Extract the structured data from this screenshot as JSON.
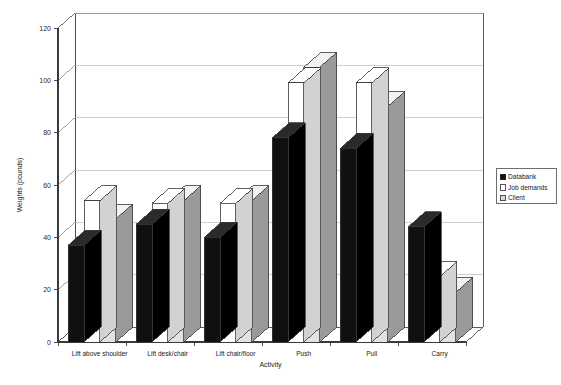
{
  "chart_data": {
    "type": "bar",
    "title": "",
    "subtitle": "",
    "xlabel": "Activity",
    "ylabel": "Weights (pounds)",
    "ylim": [
      0,
      120
    ],
    "yticks": [
      0,
      20,
      40,
      60,
      80,
      100,
      120
    ],
    "ytick_labels": [
      "0",
      "20",
      "40",
      "60",
      "80",
      "100",
      "120"
    ],
    "grid": "horizontal",
    "legend_position": "right",
    "style": "3d-grouped-columns",
    "categories": [
      "Lift above shoulder",
      "Lift desk/chair",
      "Lift chair/floor",
      "Push",
      "Pull",
      "Carry"
    ],
    "series": [
      {
        "name": "Databank",
        "color": "#101010",
        "top_color": "#2a2a2a",
        "side_color": "#000000",
        "values": [
          37,
          45,
          40,
          78,
          74,
          44
        ]
      },
      {
        "name": "Job demands",
        "color": "#ffffff",
        "top_color": "#ffffff",
        "side_color": "#d2d2d2",
        "values": [
          54,
          53,
          53,
          99,
          99,
          25
        ]
      },
      {
        "name": "Client",
        "color": "#e2e2e2",
        "top_color": "#f2f2f2",
        "side_color": "#9a9a9a",
        "values": [
          47,
          54,
          54,
          105,
          90,
          19
        ]
      }
    ]
  },
  "axes": {
    "ylabel": "Weights (pounds)",
    "xlabel": "Activity"
  },
  "legend": {
    "items": [
      {
        "label": "Databank",
        "swatch": "#101010"
      },
      {
        "label": "Job demands",
        "swatch": "#ffffff"
      },
      {
        "label": "Client",
        "swatch": "#d8d8d8"
      }
    ]
  }
}
